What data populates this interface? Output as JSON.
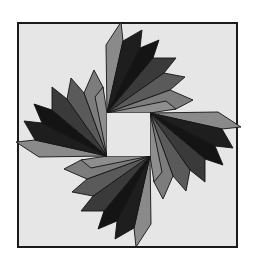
{
  "figure": {
    "background": "#ffffff",
    "frame": {
      "x": 18,
      "y": 23,
      "width": 219,
      "height": 224,
      "fill": "#e6e6e6",
      "stroke": "#1a1a1a",
      "stroke_width": 2
    },
    "center_square": {
      "x": 107,
      "y": 113,
      "width": 43,
      "height": 43,
      "fill": "#e6e6e6"
    },
    "rotation_center": [
      128.5,
      134.5
    ],
    "cluster_rotations": [
      0,
      90,
      180,
      270
    ],
    "cluster_names": [
      "top-cluster",
      "right-cluster",
      "bottom-cluster",
      "left-cluster"
    ],
    "blades": [
      {
        "name": "blade-1",
        "fill": "#8a8a8a",
        "points": "107,113 106,45 121,22 123,41"
      },
      {
        "name": "blade-2",
        "fill": "#1e1e1e",
        "points": "107,113 123,41 142,30 140,48"
      },
      {
        "name": "blade-3",
        "fill": "#141414",
        "points": "107,113 140,48 159,40 153,58"
      },
      {
        "name": "blade-4",
        "fill": "#3a3a3a",
        "points": "107,113 153,58 176,58 164,73"
      },
      {
        "name": "blade-5",
        "fill": "#5a5a5a",
        "points": "107,113 164,73 185,77 170,90"
      },
      {
        "name": "blade-6",
        "fill": "#7c7c7c",
        "points": "107,113 170,90 193,100 176,109"
      },
      {
        "name": "blade-7",
        "fill": "#8e8e8e",
        "points": "107,113 150,113 176,109 166,101"
      }
    ]
  }
}
